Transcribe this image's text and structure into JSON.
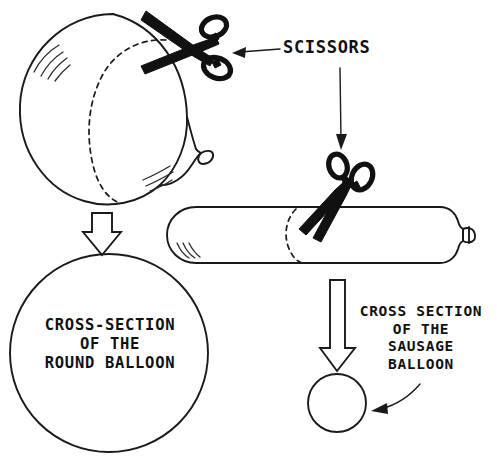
{
  "diagram": {
    "title_text": "SCISSORS",
    "labels": {
      "scissors": "SCISSORS",
      "round_cross_section": "CROSS-SECTION\nOF THE\nROUND BALLOON",
      "sausage_cross_section": "CROSS SECTION\nOF THE\nSAUSAGE\nBALLOON"
    },
    "objects": [
      {
        "name": "round-balloon",
        "description": "inflated round balloon with nozzle at lower right"
      },
      {
        "name": "sausage-balloon",
        "description": "elongated cylindrical balloon with nozzle at right end"
      },
      {
        "name": "scissors-top",
        "description": "open scissors cutting the round balloon"
      },
      {
        "name": "scissors-right",
        "description": "open scissors cutting the sausage balloon"
      },
      {
        "name": "round-cross-section-circle",
        "description": "large circle showing round balloon cross-section"
      },
      {
        "name": "sausage-cross-section-circle",
        "description": "small circle showing sausage balloon cross-section"
      }
    ],
    "arrows": [
      {
        "name": "scissors-leader-line",
        "style": "thin line with arrowhead",
        "from": "SCISSORS label",
        "to": "scissors-top"
      },
      {
        "name": "scissors-down-arrow",
        "style": "thin line with arrowhead",
        "from": "SCISSORS label",
        "to": "scissors-right"
      },
      {
        "name": "round-block-arrow",
        "style": "hollow block arrow",
        "direction": "down"
      },
      {
        "name": "sausage-block-arrow",
        "style": "hollow block arrow",
        "direction": "down"
      },
      {
        "name": "sausage-label-arrow",
        "style": "curved arrow",
        "from": "sausage label",
        "to": "sausage-cross-section-circle"
      }
    ],
    "colors": {
      "ink": "#1a1a1a",
      "fill": "#111111",
      "background": "#ffffff"
    }
  }
}
